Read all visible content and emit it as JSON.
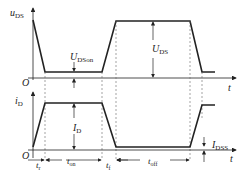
{
  "diagram": {
    "title": "",
    "upper_plot": {
      "y_label": "u",
      "y_label_sub": "DS",
      "x_label": "t",
      "origin_label": "O",
      "annotations": [
        {
          "id": "u_dson",
          "main": "U",
          "sub": "DSon"
        },
        {
          "id": "u_ds",
          "main": "U",
          "sub": "DS"
        }
      ]
    },
    "lower_plot": {
      "y_label": "i",
      "y_label_sub": "D",
      "x_label": "t",
      "origin_label": "O",
      "annotations": [
        {
          "id": "i_d",
          "main": "I",
          "sub": "D"
        },
        {
          "id": "i_dss",
          "main": "I",
          "sub": "DSS"
        }
      ]
    },
    "time_intervals": [
      {
        "id": "t_r",
        "main": "t",
        "sub": "r"
      },
      {
        "id": "t_on",
        "main": "t",
        "sub": "on"
      },
      {
        "id": "t_f",
        "main": "t",
        "sub": "f"
      },
      {
        "id": "t_off",
        "main": "t",
        "sub": "off"
      }
    ],
    "colors": {
      "line": "#222222",
      "dashed": "#555555",
      "background": "#ffffff"
    }
  }
}
